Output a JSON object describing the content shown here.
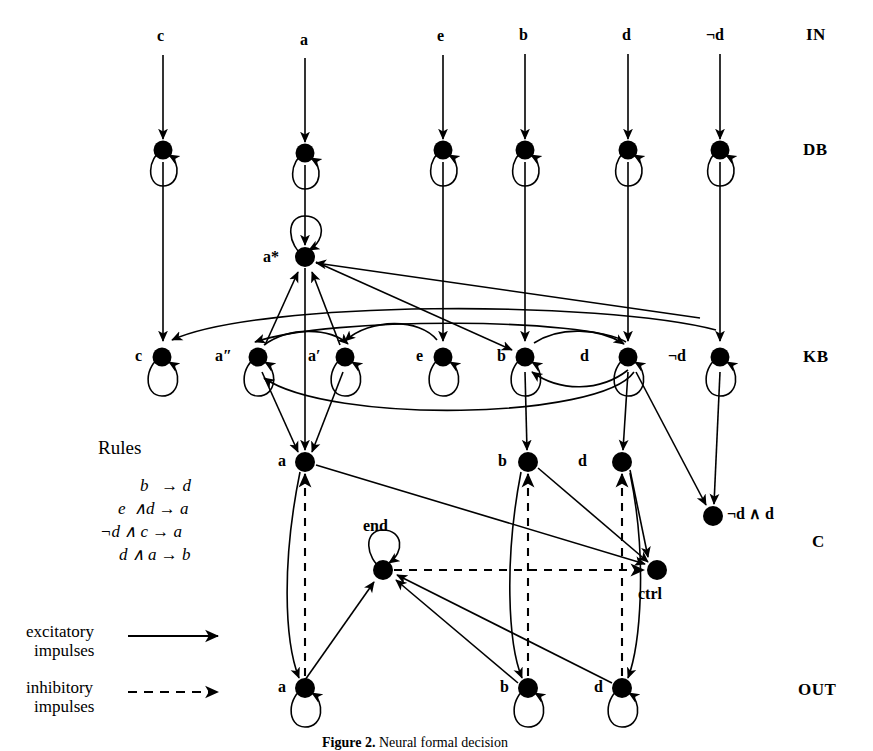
{
  "figure": {
    "caption_bold": "Figure 2.",
    "caption_rest": "Neural formal decision"
  },
  "row_labels": [
    {
      "id": "in",
      "text": "IN",
      "x": 806,
      "y": 33
    },
    {
      "id": "db",
      "text": "DB",
      "x": 806,
      "y": 141
    },
    {
      "id": "kb",
      "text": "KB",
      "x": 806,
      "y": 348
    },
    {
      "id": "c",
      "text": "C",
      "x": 812,
      "y": 533
    },
    {
      "id": "out",
      "text": "OUT",
      "x": 800,
      "y": 681
    }
  ],
  "rules": {
    "title": "Rules",
    "items": [
      {
        "antecedent": "b",
        "conjunct": "",
        "consequent": "d",
        "text": "b   → d"
      },
      {
        "antecedent": "e",
        "conjunct": "d",
        "consequent": "a",
        "text": "e  ∧d → a"
      },
      {
        "antecedent": "¬d",
        "conjunct": "c",
        "consequent": "a",
        "text": "¬d ∧ c → a"
      },
      {
        "antecedent": "d",
        "conjunct": "a",
        "consequent": "b",
        "text": "d ∧ a → b"
      }
    ]
  },
  "legend": {
    "excitatory": {
      "line1": "excitatory",
      "line2": "impulses",
      "style": "solid"
    },
    "inhibitory": {
      "line1": "inhibitory",
      "line2": "impulses",
      "style": "dashed"
    }
  },
  "layers": {
    "in": {
      "name": "IN",
      "nodes": [
        {
          "id": "in-c",
          "label": "c",
          "x": 163,
          "y": 38
        },
        {
          "id": "in-a",
          "label": "a",
          "x": 305,
          "y": 42
        },
        {
          "id": "in-e",
          "label": "e",
          "x": 443,
          "y": 38
        },
        {
          "id": "in-b",
          "label": "b",
          "x": 525,
          "y": 37
        },
        {
          "id": "in-d",
          "label": "d",
          "x": 628,
          "y": 37
        },
        {
          "id": "in-nd",
          "label": "¬d",
          "x": 720,
          "y": 37
        }
      ]
    },
    "db": {
      "name": "DB",
      "nodes": [
        {
          "id": "db-c",
          "label": "",
          "x": 163,
          "y": 150
        },
        {
          "id": "db-a",
          "label": "",
          "x": 305,
          "y": 153
        },
        {
          "id": "db-e",
          "label": "",
          "x": 443,
          "y": 150
        },
        {
          "id": "db-b",
          "label": "",
          "x": 525,
          "y": 150
        },
        {
          "id": "db-d",
          "label": "",
          "x": 628,
          "y": 150
        },
        {
          "id": "db-nd",
          "label": "",
          "x": 720,
          "y": 150
        }
      ]
    },
    "astar": {
      "name": "a*",
      "nodes": [
        {
          "id": "astar",
          "label": "a*",
          "x": 305,
          "y": 257
        }
      ]
    },
    "kb": {
      "name": "KB",
      "nodes": [
        {
          "id": "kb-c",
          "label": "c",
          "x": 162,
          "y": 357
        },
        {
          "id": "kb-a2",
          "label": "a″",
          "x": 258,
          "y": 357
        },
        {
          "id": "kb-a1",
          "label": "a′",
          "x": 345,
          "y": 357
        },
        {
          "id": "kb-e",
          "label": "e",
          "x": 443,
          "y": 357
        },
        {
          "id": "kb-b",
          "label": "b",
          "x": 525,
          "y": 357
        },
        {
          "id": "kb-d",
          "label": "d",
          "x": 628,
          "y": 357
        },
        {
          "id": "kb-nd",
          "label": "¬d",
          "x": 720,
          "y": 357
        }
      ]
    },
    "c": {
      "name": "C",
      "nodes": [
        {
          "id": "c-a",
          "label": "a",
          "x": 305,
          "y": 462
        },
        {
          "id": "c-b",
          "label": "b",
          "x": 528,
          "y": 462
        },
        {
          "id": "c-d",
          "label": "d",
          "x": 622,
          "y": 462
        },
        {
          "id": "c-ndd",
          "label": "¬d ∧ d",
          "x": 713,
          "y": 516
        },
        {
          "id": "c-end",
          "label": "end",
          "x": 383,
          "y": 570
        },
        {
          "id": "c-ctrl",
          "label": "ctrl",
          "x": 657,
          "y": 570
        }
      ]
    },
    "out": {
      "name": "OUT",
      "nodes": [
        {
          "id": "out-a",
          "label": "a",
          "x": 305,
          "y": 688
        },
        {
          "id": "out-b",
          "label": "b",
          "x": 528,
          "y": 688
        },
        {
          "id": "out-d",
          "label": "d",
          "x": 622,
          "y": 688
        }
      ]
    }
  },
  "style": {
    "ink": "#000000",
    "paper": "#ffffff",
    "node_radius": 9,
    "loop_radius": 19,
    "stroke_width": 1.6
  }
}
